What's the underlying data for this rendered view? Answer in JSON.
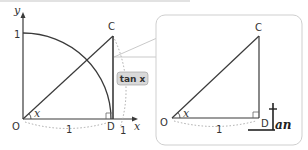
{
  "left_diagram": {
    "axis_x_label": "x",
    "axis_y_label": "y",
    "y_tick_label": "1",
    "origin_label": "O",
    "point_c_label": "C",
    "point_d_label": "D",
    "radius_label_bottom": "1",
    "arc_end_label": "1",
    "angle_label": "x",
    "tan_badge": "tan x"
  },
  "right_diagram": {
    "origin_label": "O",
    "point_c_label": "C",
    "point_d_label": "D",
    "base_label": "1",
    "angle_label": "x",
    "mnemonic_letter": "t",
    "mnemonic_text": "an"
  },
  "colors": {
    "line": "#3a3a3a",
    "dotted": "#aaaaaa",
    "box_border": "#cfcfcf",
    "badge_bg": "#d9d9d9",
    "top_rule": "#e0e0e0"
  }
}
